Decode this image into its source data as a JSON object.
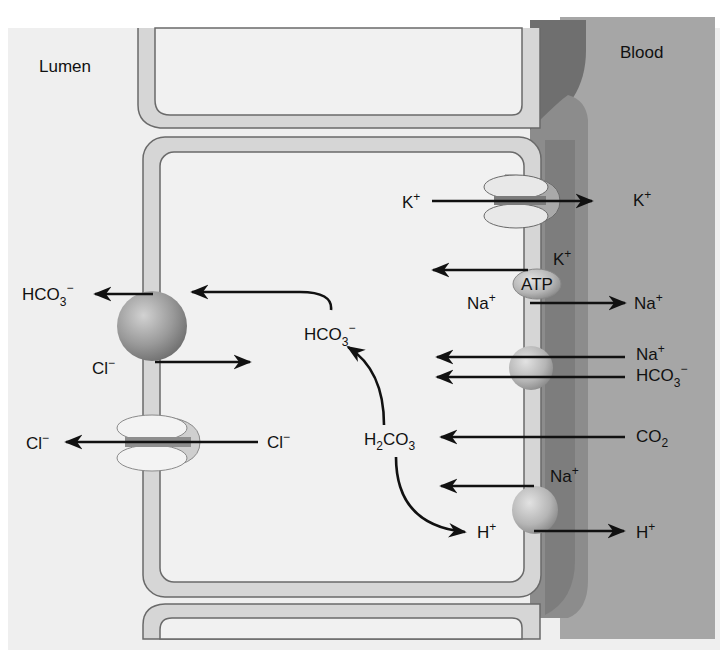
{
  "regions": {
    "lumen": "Lumen",
    "blood": "Blood"
  },
  "colors": {
    "background_lumen": "#efefef",
    "cell_interior": "#f1f1f1",
    "membrane_fill": "#d6d6d6",
    "membrane_outline": "#6a6a6a",
    "interstitial_dark": "#7a7a7a",
    "interstitial_mid": "#8e8e8e",
    "blood": "#a6a6a6",
    "arrow": "#111111",
    "text": "#111111"
  },
  "transporters": [
    {
      "id": "k-channel",
      "type": "channel",
      "location": "basolateral"
    },
    {
      "id": "na-k-atpase",
      "type": "pump",
      "label": "ATP",
      "location": "basolateral"
    },
    {
      "id": "na-hco3-cotransporter",
      "type": "carrier",
      "location": "basolateral"
    },
    {
      "id": "na-h-exchanger",
      "type": "carrier",
      "location": "basolateral"
    },
    {
      "id": "cl-hco3-exchanger",
      "type": "carrier",
      "location": "apical"
    },
    {
      "id": "cl-channel",
      "type": "channel",
      "location": "apical"
    }
  ],
  "labels": {
    "k_in": {
      "base": "K",
      "sup": "+"
    },
    "k_out": {
      "base": "K",
      "sup": "+"
    },
    "k_pump": {
      "base": "K",
      "sup": "+"
    },
    "atp": "ATP",
    "na_pump_in": {
      "base": "Na",
      "sup": "+"
    },
    "na_pump_out": {
      "base": "Na",
      "sup": "+"
    },
    "na_cotrans": {
      "base": "Na",
      "sup": "+"
    },
    "hco3_cotrans": {
      "base": "HCO",
      "sub": "3",
      "sup": "−"
    },
    "co2": {
      "base": "CO",
      "sub": "2"
    },
    "na_exch": {
      "base": "Na",
      "sup": "+"
    },
    "h_in": {
      "base": "H",
      "sup": "+"
    },
    "h_out": {
      "base": "H",
      "sup": "+"
    },
    "h2co3": {
      "pre": "H",
      "sub1": "2",
      "mid": "CO",
      "sub2": "3"
    },
    "hco3_cell": {
      "base": "HCO",
      "sub": "3",
      "sup": "−"
    },
    "hco3_lumen": {
      "base": "HCO",
      "sub": "3",
      "sup": "−"
    },
    "cl_exch": {
      "base": "Cl",
      "sup": "−"
    },
    "cl_channel_in": {
      "base": "Cl",
      "sup": "−"
    },
    "cl_channel_out": {
      "base": "Cl",
      "sup": "−"
    }
  }
}
